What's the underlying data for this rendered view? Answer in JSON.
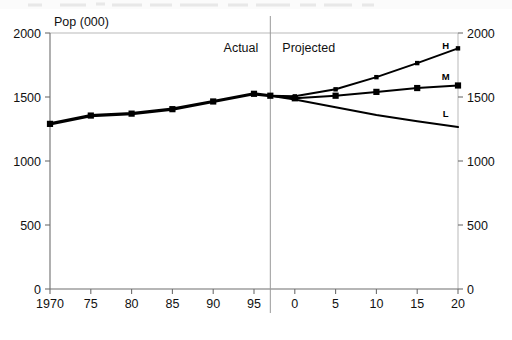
{
  "figure": {
    "cropped_top_text": "",
    "y_axis_title": "Pop (000)",
    "region_labels": {
      "actual": "Actual",
      "projected": "Projected"
    }
  },
  "axes": {
    "y_ticks": [
      "0",
      "500",
      "1000",
      "1500",
      "2000"
    ],
    "y_ticks_right": [
      "0",
      "500",
      "1000",
      "1500",
      "2000"
    ],
    "x_ticks": [
      "1970",
      "75",
      "80",
      "85",
      "90",
      "95",
      "0",
      "5",
      "10",
      "15",
      "20"
    ]
  },
  "series_labels": {
    "high": "H",
    "medium": "M",
    "low": "L"
  },
  "colors": {
    "line": "#000000",
    "axis": "#6e6e6e",
    "frame": "#b9b9b9",
    "divider": "#9a9a9a",
    "text": "#111111"
  },
  "chart_data": {
    "type": "line",
    "title": "",
    "xlabel": "",
    "ylabel": "Pop (000)",
    "ylim": [
      0,
      2000
    ],
    "xlim": [
      1970,
      2020
    ],
    "grid": false,
    "legend": "inline-end-labels",
    "annotations": [
      "Actual",
      "Projected"
    ],
    "divider_x": 1997,
    "x": [
      1970,
      1975,
      1980,
      1985,
      1990,
      1995,
      2000,
      2005,
      2010,
      2015,
      2020
    ],
    "categories": [
      "1970",
      "75",
      "80",
      "85",
      "90",
      "95",
      "0",
      "5",
      "10",
      "15",
      "20"
    ],
    "series": [
      {
        "name": "Actual",
        "label": "",
        "marker": "square",
        "x": [
          1970,
          1975,
          1980,
          1985,
          1990,
          1995,
          1997
        ],
        "values": [
          1290,
          1355,
          1370,
          1405,
          1465,
          1525,
          1510
        ]
      },
      {
        "name": "High",
        "label": "H",
        "marker": "small-square",
        "x": [
          1997,
          2000,
          2005,
          2010,
          2015,
          2020
        ],
        "values": [
          1510,
          1505,
          1560,
          1655,
          1765,
          1880
        ]
      },
      {
        "name": "Medium",
        "label": "M",
        "marker": "square",
        "x": [
          1997,
          2000,
          2005,
          2010,
          2015,
          2020
        ],
        "values": [
          1510,
          1490,
          1510,
          1540,
          1570,
          1590
        ]
      },
      {
        "name": "Low",
        "label": "L",
        "marker": "none",
        "x": [
          1997,
          2000,
          2005,
          2010,
          2015,
          2020
        ],
        "values": [
          1510,
          1480,
          1420,
          1360,
          1310,
          1265
        ]
      }
    ]
  }
}
